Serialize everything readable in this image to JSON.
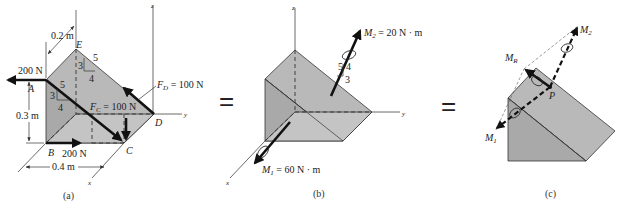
{
  "figure": {
    "panels": [
      {
        "id": "a",
        "caption": "(a)",
        "axes": {
          "x": "x",
          "y": "y",
          "z": "z"
        },
        "points": {
          "A": "A",
          "B": "B",
          "C": "C",
          "D": "D",
          "E": "E"
        },
        "dimensions": {
          "depth": "0.2 m",
          "height": "0.3 m",
          "width": "0.4 m"
        },
        "forces": {
          "A_force": "200 N",
          "B_force": "200 N",
          "FC_name": "F",
          "FC_sub": "C",
          "FC_value": " = 100 N",
          "FD_name": "F",
          "FD_sub": "D",
          "FD_value": " = 100 N"
        },
        "slope_triangles": [
          {
            "hyp": "5",
            "rise": "3",
            "run": "4"
          },
          {
            "hyp": "5",
            "rise": "3",
            "run": "4"
          }
        ]
      },
      {
        "id": "b",
        "caption": "(b)",
        "axes": {
          "x": "x",
          "y": "y",
          "z": "z"
        },
        "moments": {
          "M1_name": "M",
          "M1_sub": "1",
          "M1_value": " = 60 N · m",
          "M2_name": "M",
          "M2_sub": "2",
          "M2_value": " = 20 N · m"
        },
        "slope_triangle": {
          "hyp": "5",
          "rise": "4",
          "run": "3"
        }
      },
      {
        "id": "c",
        "caption": "(c)",
        "labels": {
          "M1_name": "M",
          "M1_sub": "1",
          "M2_name": "M",
          "M2_sub": "2",
          "MR_name": "M",
          "MR_sub": "R",
          "P": "P"
        }
      }
    ],
    "equals": [
      "=",
      "="
    ]
  }
}
